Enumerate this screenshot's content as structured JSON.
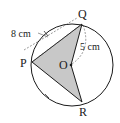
{
  "diagram": {
    "type": "circle-geometry",
    "points": {
      "P": "P",
      "Q": "Q",
      "R": "R",
      "O": "O"
    },
    "measurements": {
      "chord_pq": "8 cm",
      "radius_qo": "5 cm"
    },
    "shaded_region": "PQOR",
    "equal_arc_marks": [
      "arc PQ",
      "arc PR"
    ],
    "colors": {
      "stroke": "#1a1a1a",
      "shade": "#c8c8c8",
      "dashed": "#555555"
    }
  }
}
